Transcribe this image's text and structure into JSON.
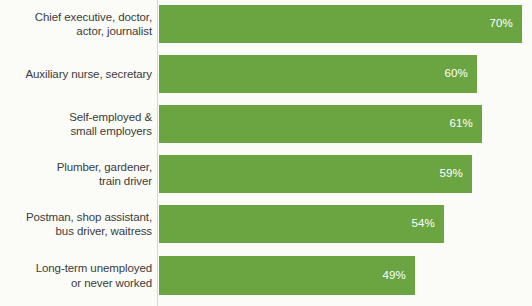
{
  "chart_data": {
    "type": "bar",
    "orientation": "horizontal",
    "title": "",
    "subtitle": "",
    "xlabel": "",
    "ylabel": "",
    "xlim": [
      0,
      70
    ],
    "grid": false,
    "legend": null,
    "value_suffix": "%",
    "categories": [
      "Chief executive, doctor,\nactor, journalist",
      "Auxiliary nurse, secretary",
      "Self-employed &\nsmall employers",
      "Plumber, gardener,\ntrain driver",
      "Postman, shop assistant,\nbus driver, waitress",
      "Long-term unemployed\nor never worked"
    ],
    "values": [
      70,
      60,
      61,
      59,
      54,
      49
    ],
    "value_labels": [
      "70%",
      "60%",
      "61%",
      "59%",
      "54%",
      "49%"
    ],
    "bar_color": "#6ba542",
    "value_label_color": "#ffffff",
    "category_label_color": "#3b3b3b",
    "background_color": "#fbfcf7",
    "axis_line_color": "#d6d8d2"
  },
  "layout": {
    "bars": [
      {
        "top": 5,
        "height": 38,
        "width": 363
      },
      {
        "top": 55,
        "height": 38,
        "width": 318
      },
      {
        "top": 105,
        "height": 38,
        "width": 323
      },
      {
        "top": 155,
        "height": 38,
        "width": 313
      },
      {
        "top": 205,
        "height": 38,
        "width": 285
      },
      {
        "top": 256,
        "height": 39,
        "width": 256
      }
    ]
  }
}
